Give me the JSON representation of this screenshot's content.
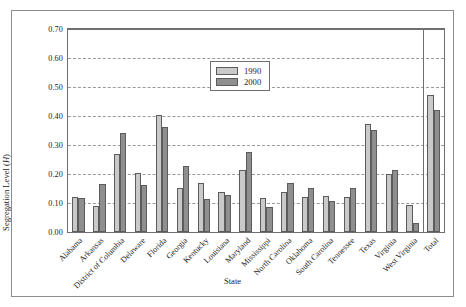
{
  "chart_data": {
    "type": "bar",
    "title": "",
    "xlabel": "State",
    "ylabel": "Segregation Level (H)",
    "ylabel_plain": "Segregation Level (",
    "ylabel_italic": "H",
    "ylabel_close": ")",
    "ylim": [
      0.0,
      0.7
    ],
    "ytick_labels": [
      "0.70",
      "0.60",
      "0.50",
      "0.40",
      "0.30",
      "0.20",
      "0.10",
      "0.00"
    ],
    "ytick_values": [
      0.7,
      0.6,
      0.5,
      0.4,
      0.3,
      0.2,
      0.1,
      0.0
    ],
    "grid": true,
    "legend_position": "upper-center-left",
    "separator_before_last_category": true,
    "categories": [
      "Alabama",
      "Arkansas",
      "District of Columbia",
      "Delaware",
      "Florida",
      "Georgia",
      "Kentucky",
      "Louisiana",
      "Maryland",
      "Mississippi",
      "North Carolina",
      "Oklahoma",
      "South Carolina",
      "Tennessee",
      "Texas",
      "Virginia",
      "West Virginia",
      "Total"
    ],
    "series": [
      {
        "name": "1990",
        "color": "#c9c9c9",
        "values": [
          0.122,
          0.09,
          0.268,
          0.203,
          0.405,
          0.153,
          0.168,
          0.137,
          0.213,
          0.118,
          0.137,
          0.122,
          0.125,
          0.12,
          0.373,
          0.199,
          0.094,
          0.472
        ]
      },
      {
        "name": "2000",
        "color": "#8f8f8f",
        "values": [
          0.116,
          0.167,
          0.34,
          0.163,
          0.362,
          0.228,
          0.113,
          0.126,
          0.277,
          0.086,
          0.168,
          0.152,
          0.107,
          0.151,
          0.353,
          0.213,
          0.032,
          0.42
        ]
      }
    ]
  },
  "legend": {
    "items": [
      {
        "label": "1990",
        "swatch": "y1990"
      },
      {
        "label": "2000",
        "swatch": "y2000"
      }
    ]
  }
}
